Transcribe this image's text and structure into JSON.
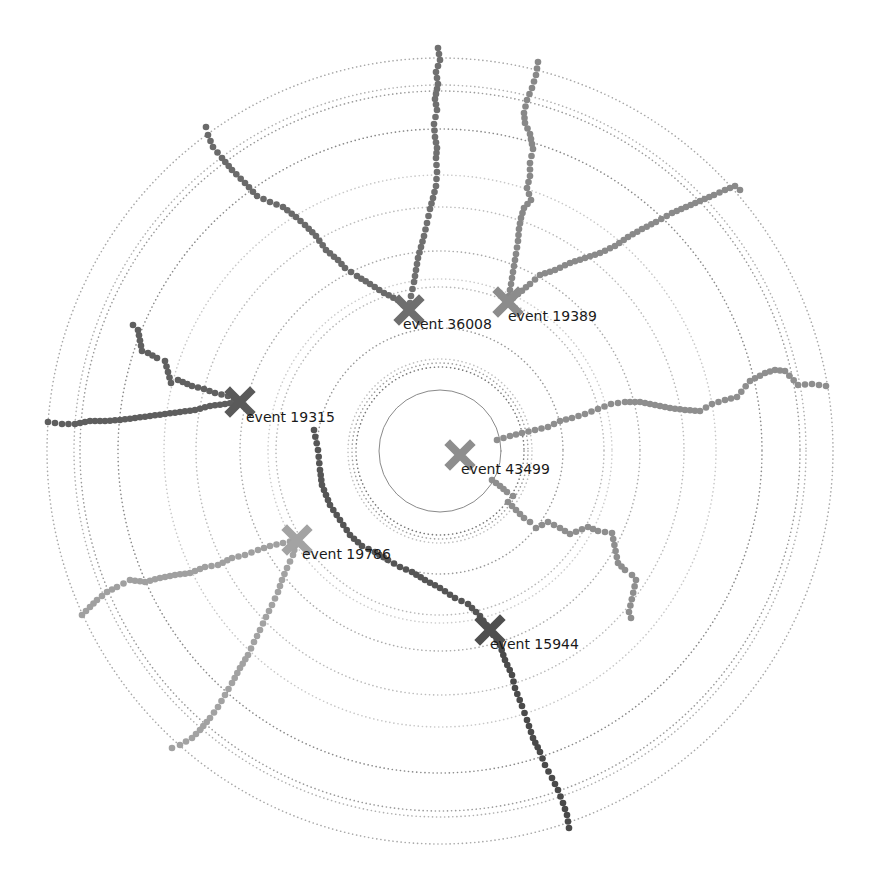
{
  "diagram": {
    "type": "radial-event-display",
    "center": [
      440,
      451
    ],
    "rings": [
      {
        "r": 61,
        "style": "solid",
        "color": "#8a8a8a"
      },
      {
        "r": 84,
        "style": "dotted",
        "color": "#777777"
      },
      {
        "r": 88,
        "style": "dotted",
        "color": "#a0a0a0"
      },
      {
        "r": 92,
        "style": "dotted",
        "color": "#c0c0c0"
      },
      {
        "r": 123,
        "style": "dotted",
        "color": "#9a9a9a"
      },
      {
        "r": 164,
        "style": "dotted",
        "color": "#b8b8b8"
      },
      {
        "r": 172,
        "style": "dotted",
        "color": "#cccccc"
      },
      {
        "r": 200,
        "style": "dotted",
        "color": "#aaaaaa"
      },
      {
        "r": 244,
        "style": "dotted",
        "color": "#bbbbbb"
      },
      {
        "r": 276,
        "style": "dotted",
        "color": "#c8c8c8"
      },
      {
        "r": 322,
        "style": "dotted",
        "color": "#8a8a8a"
      },
      {
        "r": 360,
        "style": "dotted",
        "color": "#9a9a9a"
      },
      {
        "r": 366,
        "style": "dotted",
        "color": "#b0b0b0"
      },
      {
        "r": 393,
        "style": "dotted",
        "color": "#a8a8a8"
      }
    ],
    "events": [
      {
        "id": "event-36008",
        "label": "event 36008",
        "x": 409,
        "y": 310,
        "color": "#6e6e6e",
        "label_dx": -6,
        "label_dy": 19
      },
      {
        "id": "event-19389",
        "label": "event 19389",
        "x": 508,
        "y": 302,
        "color": "#8c8c8c",
        "label_dx": 0,
        "label_dy": 19
      },
      {
        "id": "event-19315",
        "label": "event 19315",
        "x": 240,
        "y": 402,
        "color": "#5a5a5a",
        "label_dx": 6,
        "label_dy": 20
      },
      {
        "id": "event-43499",
        "label": "event 43499",
        "x": 460,
        "y": 455,
        "color": "#8e8e8e",
        "label_dx": 1,
        "label_dy": 19
      },
      {
        "id": "event-19786",
        "label": "event 19786",
        "x": 297,
        "y": 540,
        "color": "#a3a3a3",
        "label_dx": 5,
        "label_dy": 19
      },
      {
        "id": "event-15944",
        "label": "event 15944",
        "x": 490,
        "y": 630,
        "color": "#4f4f4f",
        "label_dx": 0,
        "label_dy": 19
      }
    ],
    "tracks": [
      {
        "event": "event-36008",
        "color": "#6a6a6a",
        "points": [
          [
            409,
            310
          ],
          [
            398,
            300
          ],
          [
            384,
            293
          ],
          [
            370,
            284
          ],
          [
            357,
            276
          ],
          [
            345,
            268
          ],
          [
            338,
            260
          ],
          [
            326,
            250
          ],
          [
            316,
            236
          ],
          [
            305,
            225
          ],
          [
            296,
            217
          ],
          [
            283,
            207
          ],
          [
            270,
            202
          ],
          [
            257,
            196
          ],
          [
            245,
            183
          ],
          [
            232,
            170
          ],
          [
            222,
            158
          ],
          [
            213,
            147
          ],
          [
            208,
            135
          ],
          [
            206,
            127
          ]
        ]
      },
      {
        "event": "event-36008",
        "color": "#707070",
        "points": [
          [
            409,
            310
          ],
          [
            411,
            296
          ],
          [
            414,
            282
          ],
          [
            416,
            270
          ],
          [
            418,
            258
          ],
          [
            421,
            247
          ],
          [
            424,
            236
          ],
          [
            427,
            223
          ],
          [
            430,
            209
          ],
          [
            433,
            198
          ],
          [
            436,
            186
          ],
          [
            437,
            172
          ],
          [
            436,
            158
          ],
          [
            437,
            148
          ],
          [
            435,
            137
          ],
          [
            434,
            124
          ],
          [
            437,
            110
          ],
          [
            435,
            99
          ],
          [
            438,
            84
          ],
          [
            436,
            72
          ],
          [
            440,
            60
          ],
          [
            438,
            48
          ]
        ]
      },
      {
        "event": "event-19389",
        "color": "#888888",
        "points": [
          [
            508,
            302
          ],
          [
            510,
            290
          ],
          [
            512,
            278
          ],
          [
            514,
            266
          ],
          [
            516,
            254
          ],
          [
            518,
            241
          ],
          [
            519,
            229
          ],
          [
            521,
            218
          ],
          [
            524,
            208
          ],
          [
            531,
            200
          ],
          [
            527,
            188
          ],
          [
            530,
            176
          ],
          [
            530,
            163
          ],
          [
            533,
            149
          ],
          [
            530,
            134
          ],
          [
            525,
            123
          ],
          [
            524,
            113
          ],
          [
            527,
            100
          ],
          [
            532,
            88
          ],
          [
            536,
            75
          ],
          [
            538,
            62
          ]
        ]
      },
      {
        "event": "event-19389",
        "color": "#8a8a8a",
        "points": [
          [
            508,
            302
          ],
          [
            518,
            294
          ],
          [
            530,
            284
          ],
          [
            540,
            275
          ],
          [
            555,
            270
          ],
          [
            570,
            263
          ],
          [
            585,
            258
          ],
          [
            600,
            253
          ],
          [
            615,
            246
          ],
          [
            628,
            237
          ],
          [
            642,
            229
          ],
          [
            656,
            222
          ],
          [
            672,
            213
          ],
          [
            686,
            207
          ],
          [
            700,
            201
          ],
          [
            714,
            195
          ],
          [
            725,
            190
          ],
          [
            735,
            186
          ],
          [
            740,
            190
          ]
        ]
      },
      {
        "event": "event-19315",
        "color": "#5e5e5e",
        "points": [
          [
            240,
            402
          ],
          [
            225,
            404
          ],
          [
            210,
            406
          ],
          [
            195,
            410
          ],
          [
            180,
            412
          ],
          [
            165,
            414
          ],
          [
            150,
            416
          ],
          [
            135,
            418
          ],
          [
            120,
            420
          ],
          [
            105,
            421
          ],
          [
            90,
            421
          ],
          [
            75,
            424
          ],
          [
            62,
            424
          ],
          [
            48,
            422
          ]
        ]
      },
      {
        "event": "event-19315",
        "color": "#606060",
        "points": [
          [
            240,
            402
          ],
          [
            228,
            396
          ],
          [
            215,
            393
          ],
          [
            204,
            389
          ],
          [
            192,
            386
          ],
          [
            178,
            380
          ],
          [
            171,
            383
          ],
          [
            165,
            361
          ],
          [
            157,
            358
          ],
          [
            148,
            353
          ],
          [
            142,
            351
          ],
          [
            138,
            330
          ],
          [
            133,
            325
          ]
        ]
      },
      {
        "event": "event-43499",
        "color": "#8e8e8e",
        "points": [
          [
            497,
            440
          ],
          [
            510,
            436
          ],
          [
            522,
            433
          ],
          [
            535,
            430
          ],
          [
            548,
            427
          ],
          [
            560,
            421
          ],
          [
            572,
            418
          ],
          [
            585,
            414
          ],
          [
            598,
            409
          ],
          [
            611,
            404
          ],
          [
            625,
            402
          ],
          [
            640,
            402
          ],
          [
            655,
            405
          ],
          [
            670,
            408
          ],
          [
            685,
            410
          ],
          [
            700,
            411
          ],
          [
            712,
            404
          ],
          [
            725,
            400
          ],
          [
            737,
            397
          ],
          [
            750,
            381
          ],
          [
            765,
            373
          ],
          [
            775,
            370
          ],
          [
            785,
            371
          ],
          [
            798,
            385
          ],
          [
            812,
            384
          ],
          [
            826,
            386
          ]
        ]
      },
      {
        "event": "event-43499",
        "color": "#8e8e8e",
        "points": [
          [
            492,
            480
          ],
          [
            500,
            486
          ],
          [
            507,
            492
          ],
          [
            513,
            496
          ],
          [
            508,
            502
          ],
          [
            516,
            510
          ],
          [
            524,
            518
          ],
          [
            530,
            522
          ],
          [
            536,
            528
          ],
          [
            548,
            522
          ],
          [
            560,
            528
          ],
          [
            570,
            534
          ],
          [
            588,
            527
          ],
          [
            598,
            531
          ],
          [
            612,
            533
          ],
          [
            618,
            563
          ],
          [
            625,
            570
          ],
          [
            632,
            575
          ],
          [
            636,
            580
          ],
          [
            629,
            612
          ],
          [
            631,
            618
          ]
        ]
      },
      {
        "event": "event-15944",
        "color": "#555555",
        "points": [
          [
            314,
            430
          ],
          [
            318,
            450
          ],
          [
            320,
            470
          ],
          [
            322,
            485
          ],
          [
            330,
            505
          ],
          [
            340,
            520
          ],
          [
            350,
            535
          ],
          [
            362,
            546
          ],
          [
            375,
            552
          ],
          [
            388,
            560
          ],
          [
            400,
            567
          ],
          [
            412,
            572
          ],
          [
            425,
            580
          ],
          [
            440,
            588
          ],
          [
            455,
            598
          ],
          [
            468,
            604
          ],
          [
            480,
            616
          ],
          [
            490,
            630
          ]
        ]
      },
      {
        "event": "event-15944",
        "color": "#4a4a4a",
        "points": [
          [
            490,
            630
          ],
          [
            500,
            645
          ],
          [
            505,
            660
          ],
          [
            512,
            675
          ],
          [
            515,
            688
          ],
          [
            522,
            706
          ],
          [
            527,
            720
          ],
          [
            533,
            738
          ],
          [
            540,
            752
          ],
          [
            545,
            765
          ],
          [
            552,
            778
          ],
          [
            558,
            790
          ],
          [
            563,
            803
          ],
          [
            567,
            815
          ],
          [
            569,
            828
          ]
        ]
      },
      {
        "event": "event-19786",
        "color": "#a0a0a0",
        "points": [
          [
            297,
            540
          ],
          [
            283,
            543
          ],
          [
            270,
            546
          ],
          [
            258,
            550
          ],
          [
            245,
            555
          ],
          [
            232,
            558
          ],
          [
            218,
            565
          ],
          [
            205,
            567
          ],
          [
            190,
            573
          ],
          [
            175,
            575
          ],
          [
            160,
            578
          ],
          [
            145,
            582
          ],
          [
            130,
            580
          ],
          [
            117,
            587
          ],
          [
            107,
            592
          ],
          [
            97,
            600
          ],
          [
            90,
            607
          ],
          [
            82,
            615
          ]
        ]
      },
      {
        "event": "event-19786",
        "color": "#a2a2a2",
        "points": [
          [
            297,
            540
          ],
          [
            293,
            555
          ],
          [
            287,
            568
          ],
          [
            282,
            580
          ],
          [
            278,
            592
          ],
          [
            272,
            605
          ],
          [
            266,
            617
          ],
          [
            260,
            630
          ],
          [
            254,
            642
          ],
          [
            248,
            655
          ],
          [
            240,
            668
          ],
          [
            232,
            683
          ],
          [
            225,
            695
          ],
          [
            218,
            707
          ],
          [
            210,
            718
          ],
          [
            200,
            730
          ],
          [
            192,
            738
          ],
          [
            180,
            745
          ],
          [
            172,
            748
          ]
        ]
      }
    ]
  }
}
